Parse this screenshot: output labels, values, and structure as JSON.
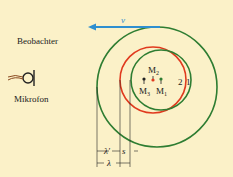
{
  "diagram": {
    "background": "#fbf1c8",
    "colors": {
      "green": "#2e7d32",
      "red": "#e03a1e",
      "blue": "#2e8fd0",
      "text": "#222222"
    },
    "labels": {
      "observer": "Beobachter",
      "microphone": "Mikrofon",
      "velocity": "v",
      "m1": "M",
      "m1_sub": "1",
      "m2": "M",
      "m2_sub": "2",
      "m3": "M",
      "m3_sub": "3",
      "wave1": "1",
      "wave2": "2",
      "lambda_prime": "λ'",
      "s": "s",
      "lambda": "λ"
    }
  }
}
